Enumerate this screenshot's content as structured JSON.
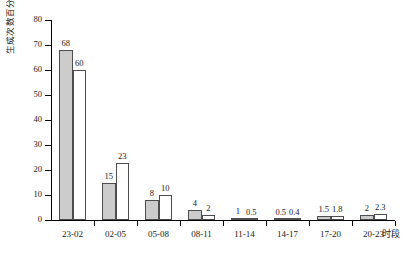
{
  "chart_data": {
    "type": "bar",
    "title": "",
    "xlabel": "时段",
    "ylabel": "生成次数百分率(%)",
    "categories": [
      "23-02",
      "02-05",
      "05-08",
      "08-11",
      "11-14",
      "14-17",
      "17-20",
      "20-23"
    ],
    "series": [
      {
        "name": "series-a",
        "fill": "#cccccc",
        "values": [
          68,
          15,
          8,
          4,
          1,
          0.5,
          1.5,
          2
        ]
      },
      {
        "name": "series-b",
        "fill": "#ffffff",
        "values": [
          60,
          23,
          10,
          2,
          0.5,
          0.4,
          1.8,
          2.3
        ]
      }
    ],
    "value_labels": [
      [
        "68",
        "15",
        "8",
        "4",
        "1",
        "0.5",
        "1.5",
        "2"
      ],
      [
        "60",
        "23",
        "10",
        "2",
        "0.5",
        "0.4",
        "1.8",
        "2.3"
      ]
    ],
    "ylim": [
      0,
      80
    ],
    "yticks": [
      0,
      10,
      20,
      30,
      40,
      50,
      60,
      70,
      80
    ],
    "ytick_labels": [
      "0",
      "10",
      "20",
      "30",
      "40",
      "50",
      "60",
      "70",
      "80"
    ],
    "grid": false,
    "legend": "none",
    "axis_color": "#000000",
    "bar_edge_color": "#4d4d4d"
  }
}
